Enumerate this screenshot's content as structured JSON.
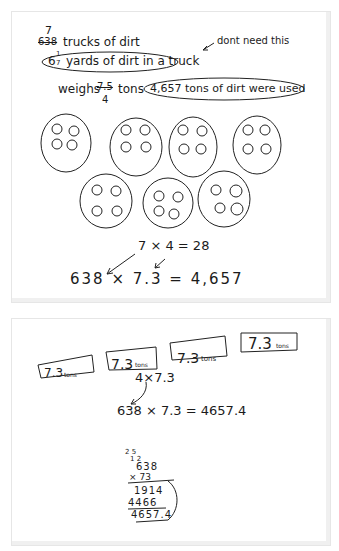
{
  "top_panel": {
    "line1": {
      "crossed_number": "638",
      "correction": "7",
      "text": "trucks of dirt"
    },
    "line2": {
      "fraction_whole": "6",
      "fraction_num": "1",
      "fraction_den": "7",
      "text": "yards of dirt in a truck"
    },
    "note": "dont need this",
    "line3": {
      "prefix": "weighs",
      "crossed": "7.5",
      "below": "4",
      "unit": "tons",
      "circled": "4,657 tons of dirt were used"
    },
    "groups": [
      {
        "dots": 4
      },
      {
        "dots": 4
      },
      {
        "dots": 4
      },
      {
        "dots": 4
      },
      {
        "dots": 4
      },
      {
        "dots": 4
      },
      {
        "dots": 4
      }
    ],
    "eq1": "7 × 4 = 28",
    "eq2": "638 × 7.3 = 4,657"
  },
  "bottom_panel": {
    "boxes": [
      {
        "value": "7.3",
        "unit": "tons"
      },
      {
        "value": "7.3",
        "unit": "tons"
      },
      {
        "value": "7.3",
        "unit": "tons"
      },
      {
        "value": "7.3",
        "unit": "tons"
      }
    ],
    "expr": "4×7.3",
    "eq": "638 × 7.3 = 4657.4",
    "long_mult": {
      "carries_top": "2  5",
      "carries_mid": "1  2",
      "multiplicand": "638",
      "multiplier": "× 73",
      "partial1": "1914",
      "partial2": "4466",
      "result": "4657.4"
    }
  }
}
